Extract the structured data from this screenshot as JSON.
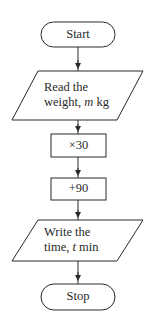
{
  "flowchart": {
    "nodes": [
      {
        "id": "start",
        "type": "terminator",
        "label": "Start"
      },
      {
        "id": "read",
        "type": "input",
        "line1": "Read the",
        "line2_prefix": "weight, ",
        "line2_var": "m",
        "line2_suffix": " kg"
      },
      {
        "id": "multiply",
        "type": "process",
        "label": "×30"
      },
      {
        "id": "add",
        "type": "process",
        "label": "+90"
      },
      {
        "id": "write",
        "type": "output",
        "line1": "Write the",
        "line2_prefix": "time, ",
        "line2_var": "t",
        "line2_suffix": " min"
      },
      {
        "id": "stop",
        "type": "terminator",
        "label": "Stop"
      }
    ],
    "edges": [
      {
        "from": "start",
        "to": "read"
      },
      {
        "from": "read",
        "to": "multiply"
      },
      {
        "from": "multiply",
        "to": "add"
      },
      {
        "from": "add",
        "to": "write"
      },
      {
        "from": "write",
        "to": "stop"
      }
    ],
    "colors": {
      "stroke": "#2a2a2a",
      "background": "#ffffff"
    }
  }
}
